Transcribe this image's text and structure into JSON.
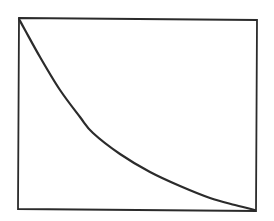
{
  "figure": {
    "width": 274,
    "height": 221,
    "background": "#ffffff",
    "stroke_color": "#2b2b2b",
    "frame": {
      "x1": 19,
      "y1": 19,
      "x2": 257,
      "y2": 210
    },
    "frame_stroke_width": 1.8,
    "curve_stroke_width": 2.2
  },
  "chart_data": {
    "type": "line",
    "title": "",
    "xlabel": "",
    "ylabel": "",
    "grid": false,
    "legend": null,
    "xlim": [
      0,
      1
    ],
    "ylim": [
      0,
      1
    ],
    "series": [
      {
        "name": "decay-curve",
        "x": [
          0.0,
          0.025,
          0.088,
          0.172,
          0.256,
          0.311,
          0.424,
          0.55,
          0.676,
          0.802,
          0.908,
          0.992
        ],
        "y": [
          1.0,
          0.942,
          0.801,
          0.628,
          0.487,
          0.403,
          0.293,
          0.199,
          0.126,
          0.063,
          0.026,
          0.0
        ]
      }
    ],
    "pixel_points": [
      [
        19,
        19
      ],
      [
        25,
        30
      ],
      [
        40,
        57
      ],
      [
        60,
        90
      ],
      [
        80,
        117
      ],
      [
        93,
        133
      ],
      [
        120,
        154
      ],
      [
        150,
        172
      ],
      [
        180,
        186
      ],
      [
        210,
        198
      ],
      [
        235,
        205
      ],
      [
        255,
        210
      ]
    ]
  }
}
